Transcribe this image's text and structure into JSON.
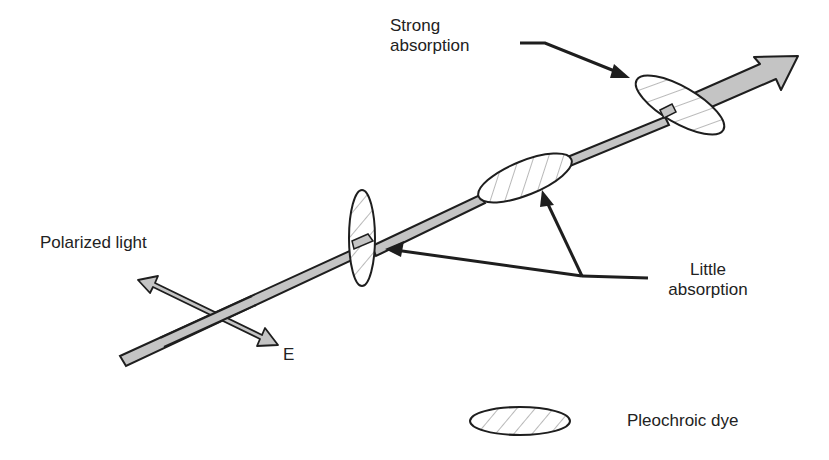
{
  "diagram": {
    "labels": {
      "strong_line1": "Strong",
      "strong_line2": "absorption",
      "little_line1": "Little",
      "little_line2": "absorption",
      "polarized": "Polarized light",
      "e_field": "E",
      "legend": "Pleochroic dye"
    },
    "colors": {
      "beam_fill": "#c4c4c4",
      "outline": "#1e1e1e",
      "text": "#222222",
      "hatch": "#8a8a8a",
      "background": "#ffffff"
    },
    "elements": [
      {
        "name": "light-beam",
        "type": "arrow",
        "from": [
          122,
          362
        ],
        "to": [
          798,
          58
        ]
      },
      {
        "name": "e-field-arrow",
        "type": "double-arrow",
        "from": [
          138,
          278
        ],
        "to": [
          276,
          344
        ]
      },
      {
        "name": "dye-molecule-vertical",
        "type": "ellipse",
        "cx": 362,
        "cy": 238,
        "rx": 13,
        "ry": 48,
        "rotation": 0
      },
      {
        "name": "dye-molecule-aligned",
        "type": "ellipse",
        "cx": 525,
        "cy": 172,
        "rx": 52,
        "ry": 20,
        "rotation": -22
      },
      {
        "name": "dye-molecule-crossed",
        "type": "ellipse",
        "cx": 680,
        "cy": 100,
        "rx": 50,
        "ry": 18,
        "rotation": 32
      },
      {
        "name": "legend-dye",
        "type": "ellipse",
        "cx": 520,
        "cy": 420,
        "rx": 50,
        "ry": 14,
        "rotation": 0
      }
    ]
  }
}
